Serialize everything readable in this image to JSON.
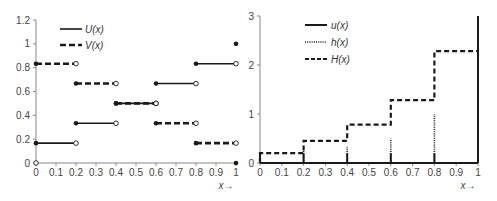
{
  "chart_data": [
    {
      "type": "line",
      "subtype": "step",
      "title": "",
      "xlabel": "x→",
      "ylabel": "",
      "xlim": [
        0,
        1
      ],
      "ylim": [
        0,
        1.2
      ],
      "x_ticks": [
        "0",
        "0.1",
        "0.2",
        "0.3",
        "0.4",
        "0.5",
        "0.6",
        "0.7",
        "0.8",
        "0.9",
        "1"
      ],
      "y_ticks": [
        "0",
        "0.2",
        "0.4",
        "0.6",
        "0.8",
        "1",
        "1.2"
      ],
      "legend_position": "upper-left",
      "grid": false,
      "series": [
        {
          "name": "U(x)",
          "style": "solid",
          "segments": [
            {
              "x0": 0,
              "x1": 0.2,
              "y": 0.1667
            },
            {
              "x0": 0.2,
              "x1": 0.4,
              "y": 0.3333
            },
            {
              "x0": 0.4,
              "x1": 0.6,
              "y": 0.5
            },
            {
              "x0": 0.6,
              "x1": 0.8,
              "y": 0.6667
            },
            {
              "x0": 0.8,
              "x1": 1.0,
              "y": 0.8333
            }
          ],
          "closed_points": [
            [
              0,
              0.1667
            ],
            [
              0.2,
              0.3333
            ],
            [
              0.4,
              0.5
            ],
            [
              0.6,
              0.6667
            ],
            [
              0.8,
              0.8333
            ],
            [
              1,
              1
            ]
          ],
          "open_points": [
            [
              0,
              0
            ],
            [
              0.2,
              0.1667
            ],
            [
              0.4,
              0.3333
            ],
            [
              0.6,
              0.5
            ],
            [
              0.8,
              0.6667
            ],
            [
              1,
              0.8333
            ]
          ]
        },
        {
          "name": "V(x)",
          "style": "dashed",
          "segments": [
            {
              "x0": 0,
              "x1": 0.2,
              "y": 0.8333
            },
            {
              "x0": 0.2,
              "x1": 0.4,
              "y": 0.6667
            },
            {
              "x0": 0.4,
              "x1": 0.6,
              "y": 0.5
            },
            {
              "x0": 0.6,
              "x1": 0.8,
              "y": 0.3333
            },
            {
              "x0": 0.8,
              "x1": 1.0,
              "y": 0.1667
            }
          ],
          "closed_points": [
            [
              0,
              0.8333
            ],
            [
              0.2,
              0.6667
            ],
            [
              0.4,
              0.5
            ],
            [
              0.6,
              0.3333
            ],
            [
              0.8,
              0.1667
            ],
            [
              1,
              0
            ]
          ],
          "open_points": [
            [
              0.2,
              0.8333
            ],
            [
              0.4,
              0.6667
            ],
            [
              0.6,
              0.5
            ],
            [
              0.8,
              0.3333
            ],
            [
              1,
              0.1667
            ]
          ]
        }
      ]
    },
    {
      "type": "line",
      "subtype": "step",
      "title": "",
      "xlabel": "x→",
      "ylabel": "",
      "xlim": [
        0,
        1
      ],
      "ylim": [
        0,
        3
      ],
      "x_ticks": [
        "0",
        "0.1",
        "0.2",
        "0.3",
        "0.4",
        "0.5",
        "0.6",
        "0.7",
        "0.8",
        "0.9",
        "1"
      ],
      "y_ticks": [
        "0",
        "1",
        "2",
        "3"
      ],
      "legend_position": "upper-left",
      "grid": false,
      "series": [
        {
          "name": "u(x)",
          "style": "solid",
          "baseline": 0,
          "spikes": [
            [
              0,
              0.2
            ],
            [
              0.2,
              0.2
            ],
            [
              0.4,
              0.2
            ],
            [
              0.6,
              0.2
            ],
            [
              0.8,
              0.2
            ],
            [
              1,
              3
            ]
          ]
        },
        {
          "name": "h(x)",
          "style": "dotted",
          "spikes": [
            [
              0,
              0.2
            ],
            [
              0.2,
              0.25
            ],
            [
              0.4,
              0.3333
            ],
            [
              0.6,
              0.5
            ],
            [
              0.8,
              1.0
            ],
            [
              1,
              2.2833
            ]
          ]
        },
        {
          "name": "H(x)",
          "style": "dashed",
          "segments": [
            {
              "x0": 0,
              "x1": 0.2,
              "y": 0.2
            },
            {
              "x0": 0.2,
              "x1": 0.4,
              "y": 0.45
            },
            {
              "x0": 0.4,
              "x1": 0.6,
              "y": 0.7833
            },
            {
              "x0": 0.6,
              "x1": 0.8,
              "y": 1.2833
            },
            {
              "x0": 0.8,
              "x1": 1.0,
              "y": 2.2833
            }
          ]
        }
      ]
    }
  ],
  "charts": {
    "left": {
      "x_arrow_label": "x→",
      "legend": [
        "U(x)",
        "V(x)"
      ]
    },
    "right": {
      "x_arrow_label": "x→",
      "legend": [
        "u(x)",
        "h(x)",
        "H(x)"
      ]
    }
  },
  "colors": {
    "line": "#1a1a1a",
    "axis": "#888888",
    "text": "#444444"
  }
}
